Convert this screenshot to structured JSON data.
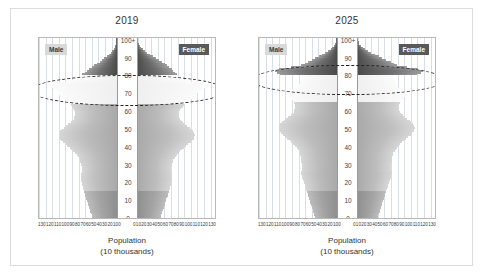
{
  "figure": {
    "axis_caption_line1": "Population",
    "axis_caption_line2": "(10 thousands)",
    "age_axis_ticks": [
      "100+",
      "90",
      "80",
      "70",
      "60",
      "50",
      "40",
      "30",
      "20",
      "10",
      "0"
    ],
    "population_ticks_left": [
      "130",
      "120",
      "110",
      "100",
      "90",
      "80",
      "70",
      "60",
      "50",
      "40",
      "30",
      "20",
      "10",
      "0"
    ],
    "population_ticks_right": [
      "0",
      "10",
      "20",
      "30",
      "40",
      "50",
      "60",
      "70",
      "80",
      "90",
      "100",
      "110",
      "120",
      "130"
    ],
    "sex_label_male": "Male",
    "sex_label_female": "Female",
    "colors": {
      "elderly_dark": "#4a4a4a",
      "boomer_light": "#f4f4f4",
      "working_mid": "#b5b5b5",
      "youth": "#9b9b9b",
      "gridline": "#d8dde6",
      "frame_border": "#dcdcdc",
      "highlight_dash": "#1c1c1c"
    }
  },
  "chart_data": [
    {
      "type": "bar",
      "title": "2019",
      "xlabel": "Population (10 thousands)",
      "ylabel": "Age",
      "xlim": [
        0,
        135
      ],
      "ylim": [
        0,
        101
      ],
      "grid": true,
      "legend_position": "inside-top-corners",
      "orientation": "population-pyramid",
      "annotation": {
        "shape": "dashed-ellipse",
        "label": "baby-boom cohort highlight",
        "age_range": [
          64,
          80
        ]
      },
      "ages": [
        0,
        1,
        2,
        3,
        4,
        5,
        6,
        7,
        8,
        9,
        10,
        11,
        12,
        13,
        14,
        15,
        16,
        17,
        18,
        19,
        20,
        21,
        22,
        23,
        24,
        25,
        26,
        27,
        28,
        29,
        30,
        31,
        32,
        33,
        34,
        35,
        36,
        37,
        38,
        39,
        40,
        41,
        42,
        43,
        44,
        45,
        46,
        47,
        48,
        49,
        50,
        51,
        52,
        53,
        54,
        55,
        56,
        57,
        58,
        59,
        60,
        61,
        62,
        63,
        64,
        65,
        66,
        67,
        68,
        69,
        70,
        71,
        72,
        73,
        74,
        75,
        76,
        77,
        78,
        79,
        80,
        81,
        82,
        83,
        84,
        85,
        86,
        87,
        88,
        89,
        90,
        91,
        92,
        93,
        94,
        95,
        96,
        97,
        98,
        99,
        100
      ],
      "series": [
        {
          "name": "Male",
          "values": [
            43,
            44,
            45,
            46,
            47,
            48,
            49,
            50,
            51,
            52,
            53,
            54,
            55,
            56,
            57,
            58,
            59,
            59,
            60,
            61,
            62,
            63,
            63,
            62,
            62,
            61,
            60,
            60,
            61,
            62,
            63,
            64,
            65,
            66,
            68,
            70,
            73,
            76,
            79,
            82,
            86,
            90,
            94,
            97,
            99,
            100,
            101,
            100,
            98,
            95,
            92,
            88,
            84,
            80,
            77,
            75,
            74,
            73,
            72,
            72,
            74,
            76,
            78,
            80,
            83,
            86,
            90,
            95,
            98,
            101,
            103,
            106,
            110,
            114,
            118,
            112,
            88,
            70,
            66,
            63,
            60,
            56,
            52,
            48,
            44,
            40,
            35,
            30,
            26,
            22,
            18,
            14,
            11,
            8,
            6,
            4,
            3,
            2,
            1,
            1,
            1
          ]
        },
        {
          "name": "Female",
          "values": [
            41,
            42,
            43,
            44,
            45,
            46,
            47,
            48,
            49,
            50,
            51,
            52,
            53,
            54,
            55,
            56,
            57,
            57,
            58,
            59,
            60,
            61,
            61,
            60,
            60,
            59,
            58,
            58,
            59,
            60,
            61,
            62,
            63,
            65,
            67,
            69,
            72,
            75,
            78,
            81,
            85,
            89,
            93,
            96,
            98,
            99,
            100,
            99,
            97,
            94,
            91,
            87,
            83,
            79,
            76,
            74,
            73,
            72,
            72,
            72,
            74,
            76,
            79,
            81,
            84,
            88,
            92,
            97,
            101,
            104,
            107,
            111,
            115,
            120,
            124,
            118,
            94,
            76,
            73,
            71,
            69,
            66,
            63,
            60,
            56,
            52,
            48,
            43,
            38,
            33,
            28,
            23,
            18,
            14,
            10,
            7,
            5,
            3,
            2,
            1,
            2
          ]
        }
      ]
    },
    {
      "type": "bar",
      "title": "2025",
      "xlabel": "Population (10 thousands)",
      "ylabel": "Age",
      "xlim": [
        0,
        135
      ],
      "ylim": [
        0,
        101
      ],
      "grid": true,
      "legend_position": "inside-top-corners",
      "orientation": "population-pyramid",
      "annotation": {
        "shape": "dashed-ellipse",
        "label": "baby-boom cohort highlight",
        "age_range": [
          70,
          86
        ]
      },
      "ages": [
        0,
        1,
        2,
        3,
        4,
        5,
        6,
        7,
        8,
        9,
        10,
        11,
        12,
        13,
        14,
        15,
        16,
        17,
        18,
        19,
        20,
        21,
        22,
        23,
        24,
        25,
        26,
        27,
        28,
        29,
        30,
        31,
        32,
        33,
        34,
        35,
        36,
        37,
        38,
        39,
        40,
        41,
        42,
        43,
        44,
        45,
        46,
        47,
        48,
        49,
        50,
        51,
        52,
        53,
        54,
        55,
        56,
        57,
        58,
        59,
        60,
        61,
        62,
        63,
        64,
        65,
        66,
        67,
        68,
        69,
        70,
        71,
        72,
        73,
        74,
        75,
        76,
        77,
        78,
        79,
        80,
        81,
        82,
        83,
        84,
        85,
        86,
        87,
        88,
        89,
        90,
        91,
        92,
        93,
        94,
        95,
        96,
        97,
        98,
        99,
        100
      ],
      "series": [
        {
          "name": "Male",
          "values": [
            38,
            39,
            40,
            41,
            42,
            43,
            44,
            45,
            46,
            47,
            48,
            49,
            50,
            51,
            52,
            53,
            54,
            55,
            56,
            57,
            58,
            59,
            60,
            61,
            62,
            62,
            61,
            61,
            60,
            60,
            61,
            62,
            62,
            63,
            63,
            64,
            65,
            66,
            68,
            70,
            73,
            76,
            79,
            82,
            86,
            90,
            94,
            97,
            99,
            100,
            101,
            100,
            98,
            95,
            92,
            88,
            84,
            80,
            77,
            75,
            74,
            73,
            72,
            72,
            74,
            76,
            78,
            80,
            83,
            86,
            84,
            78,
            72,
            68,
            66,
            64,
            63,
            62,
            61,
            60,
            99,
            104,
            108,
            100,
            80,
            62,
            56,
            50,
            44,
            38,
            32,
            26,
            20,
            15,
            11,
            8,
            5,
            3,
            2,
            1,
            1
          ]
        },
        {
          "name": "Female",
          "values": [
            36,
            37,
            38,
            39,
            40,
            41,
            42,
            43,
            44,
            45,
            46,
            47,
            48,
            49,
            50,
            51,
            52,
            53,
            54,
            55,
            56,
            57,
            58,
            59,
            60,
            60,
            59,
            59,
            58,
            58,
            59,
            60,
            60,
            61,
            61,
            62,
            63,
            65,
            67,
            69,
            72,
            75,
            78,
            81,
            85,
            89,
            93,
            96,
            98,
            99,
            100,
            99,
            97,
            94,
            91,
            87,
            83,
            79,
            76,
            74,
            73,
            72,
            72,
            72,
            74,
            76,
            79,
            81,
            84,
            88,
            86,
            80,
            75,
            71,
            69,
            67,
            66,
            65,
            64,
            63,
            104,
            110,
            114,
            106,
            86,
            70,
            64,
            58,
            51,
            44,
            38,
            31,
            25,
            19,
            14,
            10,
            7,
            4,
            3,
            2,
            2
          ]
        }
      ]
    }
  ]
}
